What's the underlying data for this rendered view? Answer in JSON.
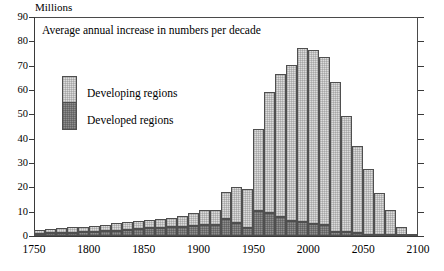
{
  "unit_label": "Millions",
  "title": "Average annual increase in numbers per decade",
  "legend": {
    "developing": "Developing regions",
    "developed": "Developed regions"
  },
  "axes": {
    "y_ticks": [
      0,
      10,
      20,
      30,
      40,
      50,
      60,
      70,
      80,
      90
    ],
    "x_ticks": [
      1750,
      1800,
      1850,
      1900,
      1950,
      2000,
      2050,
      2100
    ]
  },
  "colors": {
    "developing": "#dcdcdc",
    "developed": "#8e8e8e",
    "axis": "#3a3a3a",
    "bar_outline": "#4f4f4f",
    "background": "#ffffff"
  },
  "chart_data": {
    "type": "bar",
    "stacked": true,
    "title": "Average annual increase in numbers per decade",
    "xlabel": "",
    "ylabel": "Millions",
    "ylim": [
      0,
      90
    ],
    "xlim": [
      1750,
      2100
    ],
    "grid": false,
    "legend_position": "inside-upper-left",
    "categories": [
      "1750",
      "1760",
      "1770",
      "1780",
      "1790",
      "1800",
      "1810",
      "1820",
      "1830",
      "1840",
      "1850",
      "1860",
      "1870",
      "1880",
      "1890",
      "1900",
      "1910",
      "1920",
      "1930",
      "1940",
      "1950",
      "1960",
      "1970",
      "1980",
      "1990",
      "2000",
      "2010",
      "2020",
      "2030",
      "2040",
      "2050",
      "2060",
      "2070",
      "2080",
      "2090"
    ],
    "series": [
      {
        "name": "Developed regions",
        "values": [
          1.0,
          1.2,
          1.3,
          1.4,
          1.6,
          1.8,
          2.0,
          2.2,
          2.5,
          2.8,
          3.1,
          3.4,
          3.7,
          3.9,
          4.2,
          4.4,
          4.6,
          7.1,
          5.3,
          3.3,
          10.1,
          9.3,
          7.7,
          6.1,
          5.6,
          5.0,
          4.6,
          1.8,
          1.6,
          1.1,
          0.6,
          0.4,
          0.3,
          0.2,
          0.1
        ]
      },
      {
        "name": "Developing regions",
        "values": [
          1.4,
          1.7,
          1.9,
          2.1,
          2.3,
          2.4,
          2.6,
          3.0,
          3.2,
          3.3,
          3.4,
          3.6,
          3.8,
          4.5,
          5.1,
          6.3,
          6.1,
          10.8,
          14.8,
          16.0,
          34.0,
          49.8,
          58.8,
          64.3,
          71.5,
          71.6,
          68.9,
          61.6,
          47.8,
          35.8,
          27.1,
          17.4,
          10.3,
          3.6,
          0.4
        ]
      }
    ],
    "totals": [
      2.4,
      2.9,
      3.2,
      3.5,
      3.9,
      4.2,
      4.6,
      5.2,
      5.7,
      6.1,
      6.5,
      7.0,
      7.5,
      8.4,
      9.3,
      10.7,
      10.7,
      17.9,
      20.1,
      19.3,
      44.1,
      59.1,
      66.5,
      70.4,
      77.1,
      76.6,
      73.5,
      63.4,
      49.4,
      36.9,
      27.7,
      17.8,
      10.6,
      3.8,
      0.5
    ],
    "annotations": [
      "Peak total of about 77 million per year occurs in the 1990 decade.",
      "Developed regions peak at about 10 million per year in the 1950 decade."
    ]
  }
}
